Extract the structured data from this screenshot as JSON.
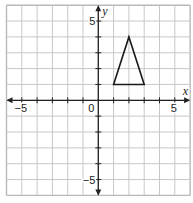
{
  "diagram": {
    "type": "coordinate-grid",
    "x_range": [
      -6,
      6
    ],
    "y_range": [
      -6,
      6
    ],
    "grid_step": 1,
    "axis_labels": {
      "x": "x",
      "y": "y"
    },
    "tick_labels": [
      {
        "axis": "x",
        "value": -5,
        "text": "−5"
      },
      {
        "axis": "x",
        "value": 5,
        "text": "5"
      },
      {
        "axis": "y",
        "value": 5,
        "text": "5"
      },
      {
        "axis": "y",
        "value": -5,
        "text": "−5"
      }
    ],
    "origin_label": "0",
    "shapes": [
      {
        "name": "triangle",
        "vertices": [
          [
            1,
            1
          ],
          [
            3,
            1
          ],
          [
            2,
            4
          ]
        ]
      }
    ],
    "colors": {
      "grid": "#c8c8c8",
      "axis": "#222222",
      "shape": "#1a1a1a",
      "border": "#b8b8b8"
    }
  },
  "chart_data": {
    "type": "scatter",
    "title": "",
    "xlabel": "x",
    "ylabel": "y",
    "xlim": [
      -6,
      6
    ],
    "ylim": [
      -6,
      6
    ],
    "grid": true,
    "x_ticks_labeled": [
      -5,
      5
    ],
    "y_ticks_labeled": [
      -5,
      5
    ],
    "series": [
      {
        "name": "triangle",
        "x": [
          1,
          3,
          2,
          1
        ],
        "y": [
          1,
          1,
          4,
          1
        ]
      }
    ]
  }
}
